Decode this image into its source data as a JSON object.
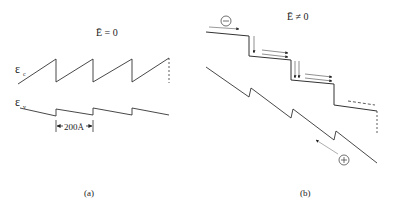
{
  "figure": {
    "panels": [
      {
        "id": "a",
        "title": "Ē = 0",
        "caption": "(a)",
        "conduction_label": "ε",
        "conduction_sub": "c",
        "valence_label": "ε",
        "valence_sub": "v",
        "period_label": "200Å"
      },
      {
        "id": "b",
        "title": "Ē ≠ 0",
        "caption": "(b)",
        "electron_symbol": "−",
        "hole_symbol": "+"
      }
    ],
    "line_color": "#333333"
  }
}
